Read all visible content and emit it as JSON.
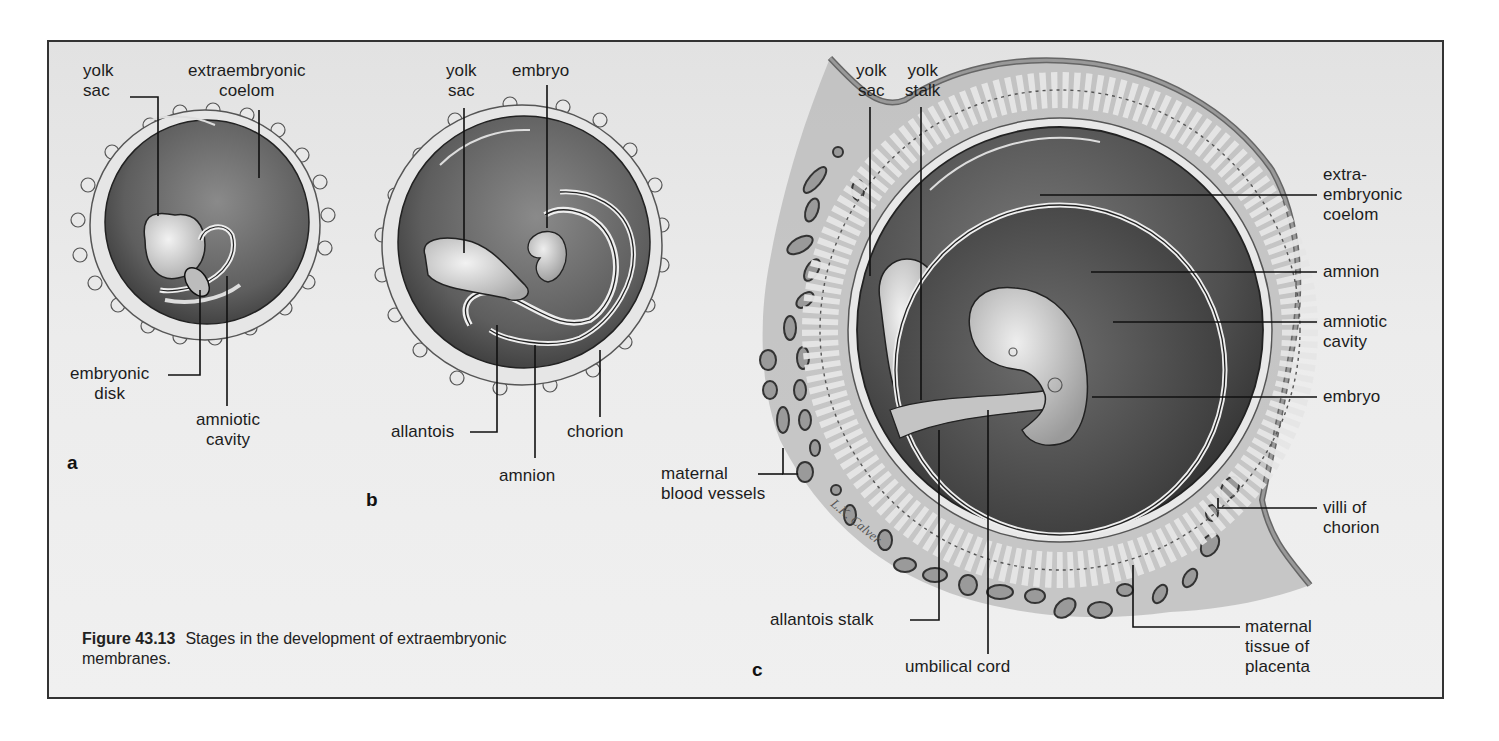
{
  "figure": {
    "number": "Figure 43.13",
    "caption_line1": "Stages in the development of extraembryonic",
    "caption_line2": "membranes."
  },
  "panels": {
    "a": {
      "letter": "a",
      "labels": {
        "yolk_sac": "yolk\nsac",
        "extraembryonic_coelom": "extraembryonic\ncoelom",
        "embryonic_disk": "embryonic\ndisk",
        "amniotic_cavity": "amniotic\ncavity"
      }
    },
    "b": {
      "letter": "b",
      "labels": {
        "yolk_sac": "yolk\nsac",
        "embryo": "embryo",
        "allantois": "allantois",
        "amnion": "amnion",
        "chorion": "chorion"
      }
    },
    "c": {
      "letter": "c",
      "labels": {
        "yolk_sac": "yolk\nsac",
        "yolk_stalk": "yolk\nstalk",
        "extraembryonic_coelom": "extra-\nembryonic\ncoelom",
        "amnion": "amnion",
        "amniotic_cavity": "amniotic\ncavity",
        "embryo": "embryo",
        "maternal_blood_vessels": "maternal\nblood vessels",
        "villi_of_chorion": "villi of\nchorion",
        "allantois_stalk": "allantois stalk",
        "umbilical_cord": "umbilical cord",
        "maternal_tissue_of_placenta": "maternal\ntissue of\nplacenta"
      }
    }
  },
  "colors": {
    "background": "#ebebeb",
    "frame": "#333333",
    "chorion_ring": "#e6e6e6",
    "coelom_dark": "#5a5a5a",
    "leader_line": "#111111",
    "text": "#1c1c1c"
  }
}
